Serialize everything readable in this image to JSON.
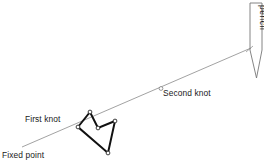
{
  "figure": {
    "background_color": "#ffffff",
    "width": 264,
    "height": 164
  },
  "labels": {
    "fixed_point": "Fixed point",
    "first_knot": "First knot",
    "second_knot": "Second knot",
    "pencil": "pencil"
  },
  "colors": {
    "string": "#8a8a8a",
    "knot_stroke": "#111111",
    "node_fill": "#ffffff",
    "text": "#1a1a1a",
    "pencil_outline": "#777777"
  },
  "geometry": {
    "string_start": [
      22,
      147
    ],
    "string_end": [
      251,
      48
    ],
    "second_knot_marker": [
      161,
      88
    ],
    "first_knot_anchor": [
      78,
      127
    ],
    "knot_polyline": [
      [
        78,
        127
      ],
      [
        90,
        112
      ],
      [
        98,
        128
      ],
      [
        115,
        121
      ],
      [
        108,
        153
      ],
      [
        78,
        127
      ]
    ],
    "knot_nodes": [
      [
        78,
        127
      ],
      [
        90,
        112
      ],
      [
        98,
        128
      ],
      [
        115,
        121
      ],
      [
        108,
        153
      ]
    ],
    "pencil_body": [
      [
        250,
        3
      ],
      [
        262,
        3
      ],
      [
        262,
        50
      ],
      [
        250,
        50
      ]
    ],
    "pencil_tip": [
      [
        250,
        50
      ],
      [
        256,
        78
      ],
      [
        262,
        50
      ]
    ],
    "pencil_contact": [
      251,
      48
    ]
  }
}
